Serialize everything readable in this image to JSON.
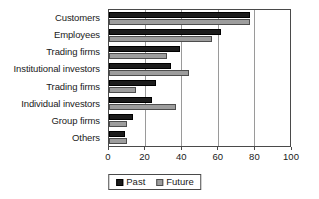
{
  "chart_data": {
    "type": "bar",
    "orientation": "horizontal",
    "title": "",
    "xlabel": "",
    "ylabel": "",
    "xlim": [
      0,
      100
    ],
    "xticks": [
      0,
      20,
      40,
      60,
      80,
      100
    ],
    "xtick_labels": [
      "0",
      "20",
      "40",
      "60",
      "80",
      "100"
    ],
    "grid": "vertical",
    "legend_position": "bottom-center",
    "categories": [
      "Customers",
      "Employees",
      "Trading firms",
      "Institutional investors",
      "Trading firms",
      "Individual investors",
      "Group firms",
      "Others"
    ],
    "series": [
      {
        "name": "Past",
        "color": "#1c1c1c",
        "values": [
          78,
          62,
          39,
          34,
          26,
          24,
          13,
          9
        ]
      },
      {
        "name": "Future",
        "color": "#9d9d9d",
        "values": [
          78,
          57,
          32,
          44,
          15,
          37,
          10,
          10
        ]
      }
    ]
  }
}
